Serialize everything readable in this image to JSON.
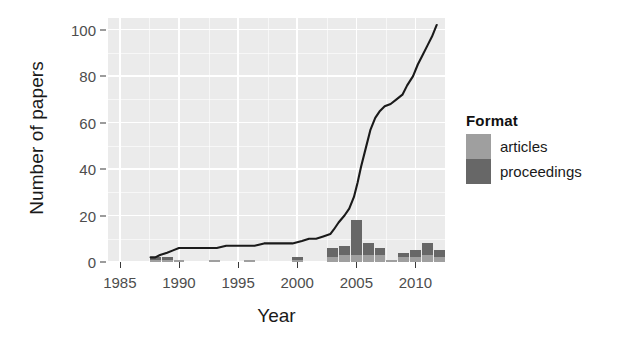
{
  "chart_data": {
    "type": "bar",
    "title": "",
    "subtitle": "",
    "xlabel": "Year",
    "ylabel": "Number of papers",
    "xlim": [
      1984,
      2012.5
    ],
    "ylim": [
      0,
      105
    ],
    "xticks": [
      1985,
      1990,
      1995,
      2000,
      2005,
      2010
    ],
    "yticks": [
      0,
      20,
      40,
      60,
      80,
      100
    ],
    "xtick_labels": [
      "1985",
      "1990",
      "1995",
      "2000",
      "2005",
      "2010"
    ],
    "ytick_labels": [
      "0",
      "20",
      "40",
      "60",
      "80",
      "100"
    ],
    "grid": true,
    "legend": {
      "title": "Format",
      "position": "right",
      "entries": [
        {
          "name": "articles",
          "color": "#9f9f9f"
        },
        {
          "name": "proceedings",
          "color": "#676767"
        }
      ]
    },
    "x": [
      1985,
      1986,
      1987,
      1988,
      1989,
      1990,
      1991,
      1992,
      1993,
      1994,
      1995,
      1996,
      1997,
      1998,
      1999,
      2000,
      2001,
      2002,
      2003,
      2004,
      2005,
      2006,
      2007,
      2008,
      2009,
      2010,
      2011,
      2012
    ],
    "series": [
      {
        "name": "articles",
        "color": "#9f9f9f",
        "values": [
          0,
          0,
          0,
          1,
          1,
          1,
          0,
          0,
          1,
          0,
          0,
          1,
          0,
          0,
          0,
          1,
          0,
          0,
          2,
          3,
          3,
          3,
          3,
          1,
          2,
          2,
          3,
          2
        ]
      },
      {
        "name": "proceedings",
        "color": "#676767",
        "values": [
          0,
          0,
          0,
          1,
          1,
          0,
          0,
          0,
          0,
          0,
          0,
          0,
          0,
          0,
          0,
          1,
          0,
          0,
          4,
          4,
          15,
          5,
          3,
          0,
          2,
          3,
          5,
          3
        ]
      }
    ],
    "cumulative_line": {
      "name": "cumulative papers",
      "color": "#1a1a1a",
      "x": [
        1987.6,
        1988,
        1988.4,
        1989,
        1989.5,
        1990,
        1990.6,
        1991.4,
        1992.4,
        1993.2,
        1994,
        1994.8,
        1995.6,
        1996.4,
        1997.2,
        1998,
        1998.8,
        1999.6,
        2000.4,
        2001,
        2001.6,
        2002.2,
        2002.8,
        2003.1,
        2003.5,
        2004,
        2004.4,
        2004.8,
        2005.1,
        2005.4,
        2005.8,
        2006.2,
        2006.6,
        2007,
        2007.4,
        2007.9,
        2008.4,
        2008.9,
        2009.3,
        2009.8,
        2010.2,
        2010.6,
        2011,
        2011.4,
        2011.8
      ],
      "y": [
        2,
        2,
        3,
        4,
        5,
        6,
        6,
        6,
        6,
        6,
        7,
        7,
        7,
        7,
        8,
        8,
        8,
        8,
        9,
        10,
        10,
        11,
        12,
        14,
        17,
        20,
        23,
        28,
        34,
        41,
        49,
        57,
        62,
        65,
        67,
        68,
        70,
        72,
        76,
        80,
        85,
        89,
        93,
        97,
        102
      ]
    }
  }
}
